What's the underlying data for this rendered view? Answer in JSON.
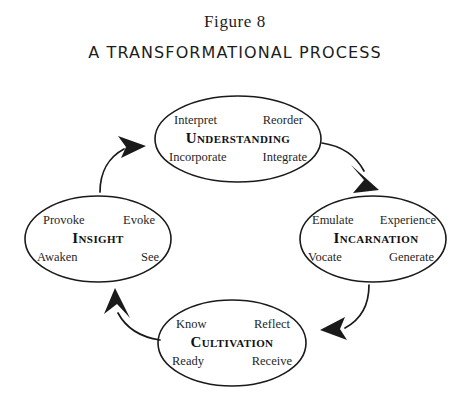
{
  "figure": {
    "label": "Figure 8",
    "subtitle": "A TRANSFORMATIONAL PROCESS"
  },
  "diagram": {
    "type": "cycle-diagram",
    "stroke_color": "#1a1a1a",
    "fill_color": "#ffffff",
    "background_color": "#ffffff",
    "nodes": [
      {
        "id": "understanding",
        "title": "Understanding",
        "position": "top",
        "words": {
          "top_left": "Interpret",
          "top_right": "Reorder",
          "bottom_left": "Incorporate",
          "bottom_right": "Integrate"
        }
      },
      {
        "id": "incarnation",
        "title": "Incarnation",
        "position": "right",
        "words": {
          "top_left": "Emulate",
          "top_right": "Experience",
          "bottom_left": "Vocate",
          "bottom_right": "Generate"
        }
      },
      {
        "id": "cultivation",
        "title": "Cultivation",
        "position": "bottom",
        "words": {
          "top_left": "Know",
          "top_right": "Reflect",
          "bottom_left": "Ready",
          "bottom_right": "Receive"
        }
      },
      {
        "id": "insight",
        "title": "Insight",
        "position": "left",
        "words": {
          "top_left": "Provoke",
          "top_right": "Evoke",
          "bottom_left": "Awaken",
          "bottom_right": "See"
        }
      }
    ],
    "arrows": [
      {
        "id": "insight-to-understanding",
        "from": "insight",
        "to": "understanding",
        "direction": "up-right"
      },
      {
        "id": "understanding-to-incarnation",
        "from": "understanding",
        "to": "incarnation",
        "direction": "down-right"
      },
      {
        "id": "incarnation-to-cultivation",
        "from": "incarnation",
        "to": "cultivation",
        "direction": "down-left"
      },
      {
        "id": "cultivation-to-insight",
        "from": "cultivation",
        "to": "insight",
        "direction": "up-left"
      }
    ]
  }
}
